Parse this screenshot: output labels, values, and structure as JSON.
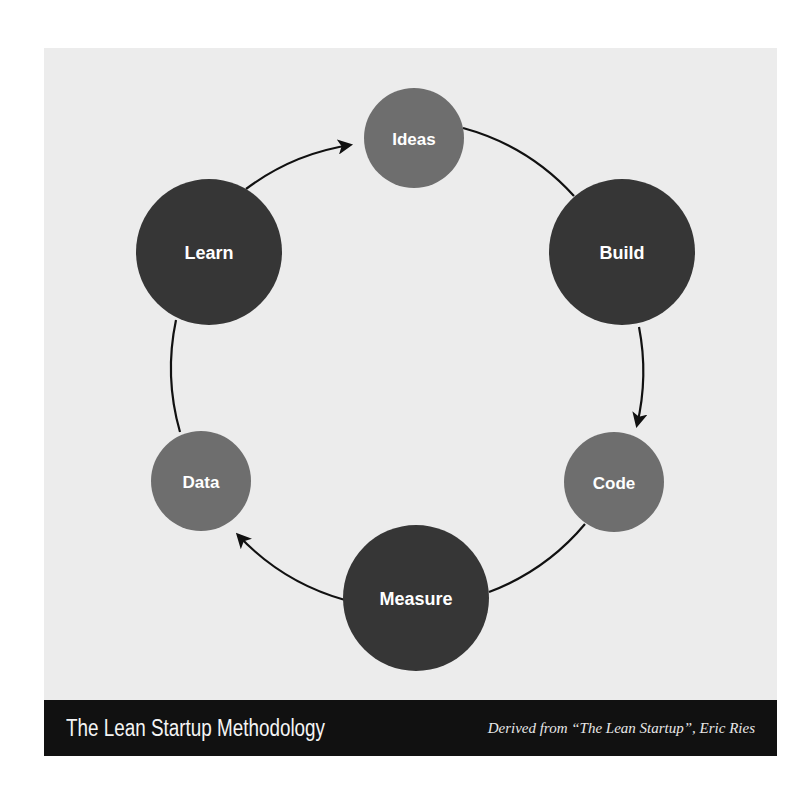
{
  "diagram": {
    "title": "The Lean Startup Methodology",
    "credit": "Derived from “The Lean Startup”, Eric Ries",
    "colors": {
      "background": "#ececec",
      "major_node": "#363636",
      "minor_node": "#6e6e6e",
      "label": "#ffffff",
      "edge": "#111111",
      "banner": "#111111"
    },
    "nodes": [
      {
        "id": "ideas",
        "label": "Ideas",
        "type": "minor"
      },
      {
        "id": "build",
        "label": "Build",
        "type": "major"
      },
      {
        "id": "code",
        "label": "Code",
        "type": "minor"
      },
      {
        "id": "measure",
        "label": "Measure",
        "type": "major"
      },
      {
        "id": "data",
        "label": "Data",
        "type": "minor"
      },
      {
        "id": "learn",
        "label": "Learn",
        "type": "major"
      }
    ],
    "edges": [
      {
        "from": "ideas",
        "to": "build",
        "arrow": false
      },
      {
        "from": "build",
        "to": "code",
        "arrow": true
      },
      {
        "from": "code",
        "to": "measure",
        "arrow": false
      },
      {
        "from": "measure",
        "to": "data",
        "arrow": true
      },
      {
        "from": "data",
        "to": "learn",
        "arrow": false
      },
      {
        "from": "learn",
        "to": "ideas",
        "arrow": true
      }
    ]
  }
}
